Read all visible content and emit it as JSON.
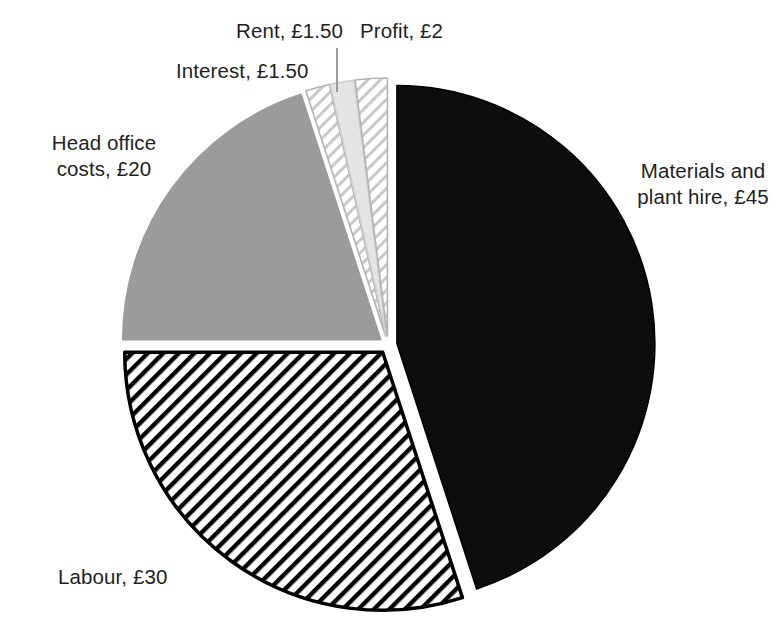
{
  "chart_data": {
    "type": "pie",
    "title": "",
    "currency": "£",
    "total": 100,
    "units": "GBP",
    "categories": [
      "Materials and plant hire",
      "Labour",
      "Head office costs",
      "Interest",
      "Rent",
      "Profit"
    ],
    "values": [
      45,
      30,
      20,
      1.5,
      1.5,
      2
    ],
    "labels": [
      "Materials and\nplant hire, £45",
      "Labour, £30",
      "Head office\ncosts, £20",
      "Interest, £1.50",
      "Rent, £1.50",
      "Profit, £2"
    ],
    "slices": [
      {
        "name": "materials-and-plant-hire",
        "label_line1": "Materials and",
        "label_line2": "plant hire, £45",
        "value": 45,
        "value_text": "£45",
        "fill": "#0d0d0d",
        "fill_style": "solid",
        "stroke": "#000000",
        "start_angle": 0,
        "end_angle": 162,
        "explode": 9
      },
      {
        "name": "labour",
        "label_line1": "Labour, £30",
        "label_line2": "",
        "value": 30,
        "value_text": "£30",
        "fill": "#ffffff",
        "fill_style": "diagonal-hatch-dark",
        "stroke": "#000000",
        "start_angle": 162,
        "end_angle": 270,
        "explode": 9
      },
      {
        "name": "head-office-costs",
        "label_line1": "Head office",
        "label_line2": "costs, £20",
        "value": 20,
        "value_text": "£20",
        "fill": "#9b9b9b",
        "fill_style": "solid",
        "stroke": "#9b9b9b",
        "start_angle": 270,
        "end_angle": 342,
        "explode": 9
      },
      {
        "name": "interest",
        "label_line1": "Interest, £1.50",
        "label_line2": "",
        "value": 1.5,
        "value_text": "£1.50",
        "fill": "#ffffff",
        "fill_style": "diagonal-hatch-light",
        "stroke": "#b3b3b3",
        "start_angle": 342,
        "end_angle": 347.4,
        "explode": 9
      },
      {
        "name": "rent",
        "label_line1": "Rent, £1.50",
        "label_line2": "",
        "value": 1.5,
        "value_text": "£1.50",
        "fill": "#e4e4e4",
        "fill_style": "solid",
        "stroke": "#d0d0d0",
        "start_angle": 347.4,
        "end_angle": 352.8,
        "explode": 9
      },
      {
        "name": "profit",
        "label_line1": "Profit, £2",
        "label_line2": "",
        "value": 2,
        "value_text": "£2",
        "fill": "#ffffff",
        "fill_style": "diagonal-hatch-light",
        "stroke": "#b3b3b3",
        "start_angle": 352.8,
        "end_angle": 360,
        "explode": 9
      }
    ],
    "leader_lines": [
      {
        "name": "rent-leader-line",
        "x1": 337,
        "y1": 48,
        "x2": 337,
        "y2": 92
      }
    ],
    "legend": "none",
    "grid": false,
    "background": "#ffffff",
    "text_color": "#231f20"
  }
}
